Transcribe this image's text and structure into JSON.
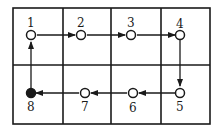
{
  "diagram": {
    "grid": {
      "rows": 2,
      "cols": 4
    },
    "nodes": [
      {
        "id": "1",
        "label": "1",
        "filled": false
      },
      {
        "id": "2",
        "label": "2",
        "filled": false
      },
      {
        "id": "3",
        "label": "3",
        "filled": false
      },
      {
        "id": "4",
        "label": "4",
        "filled": false
      },
      {
        "id": "5",
        "label": "5",
        "filled": false
      },
      {
        "id": "6",
        "label": "6",
        "filled": false
      },
      {
        "id": "7",
        "label": "7",
        "filled": false
      },
      {
        "id": "8",
        "label": "8",
        "filled": true
      }
    ],
    "edges": [
      {
        "from": "1",
        "to": "2"
      },
      {
        "from": "2",
        "to": "3"
      },
      {
        "from": "3",
        "to": "4"
      },
      {
        "from": "4",
        "to": "5"
      },
      {
        "from": "5",
        "to": "6"
      },
      {
        "from": "6",
        "to": "7"
      },
      {
        "from": "7",
        "to": "8"
      },
      {
        "from": "8",
        "to": "1"
      }
    ],
    "colors": {
      "line": "#1a1a1a",
      "background": "#ffffff"
    }
  }
}
